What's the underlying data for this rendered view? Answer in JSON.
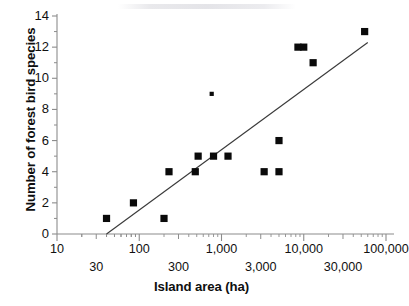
{
  "chart_data": {
    "type": "scatter",
    "title": "",
    "xlabel": "Island area (ha)",
    "ylabel": "Number of forest bird species",
    "xscale": "log",
    "xlim": [
      10,
      100000
    ],
    "ylim": [
      0,
      14
    ],
    "grid": false,
    "legend": "none",
    "y_ticks": [
      0,
      2,
      4,
      6,
      8,
      10,
      12,
      14
    ],
    "y_tick_labels": [
      "0",
      "2",
      "4",
      "6",
      "8",
      "10",
      "12",
      "14"
    ],
    "y_minor_ticks": [
      1,
      3,
      5,
      7,
      9,
      11,
      13
    ],
    "x_ticks_upper": [
      10,
      100,
      1000,
      10000,
      100000
    ],
    "x_tick_labels_upper": [
      "10",
      "100",
      "1,000",
      "10,000",
      "100,000"
    ],
    "x_ticks_lower": [
      30,
      300,
      3000,
      30000
    ],
    "x_tick_labels_lower": [
      "30",
      "300",
      "3,000",
      "30,000"
    ],
    "points": [
      {
        "x": 40,
        "y": 1,
        "size": "normal"
      },
      {
        "x": 85,
        "y": 2,
        "size": "normal"
      },
      {
        "x": 200,
        "y": 1,
        "size": "normal"
      },
      {
        "x": 230,
        "y": 4,
        "size": "normal"
      },
      {
        "x": 480,
        "y": 4,
        "size": "normal"
      },
      {
        "x": 520,
        "y": 5,
        "size": "normal"
      },
      {
        "x": 760,
        "y": 9,
        "size": "small"
      },
      {
        "x": 800,
        "y": 5,
        "size": "normal"
      },
      {
        "x": 1200,
        "y": 5,
        "size": "normal"
      },
      {
        "x": 3300,
        "y": 4,
        "size": "normal"
      },
      {
        "x": 5000,
        "y": 4,
        "size": "normal"
      },
      {
        "x": 5000,
        "y": 6,
        "size": "normal"
      },
      {
        "x": 8500,
        "y": 12,
        "size": "normal"
      },
      {
        "x": 10000,
        "y": 12,
        "size": "normal"
      },
      {
        "x": 13000,
        "y": 11,
        "size": "normal"
      },
      {
        "x": 55000,
        "y": 13,
        "size": "normal"
      }
    ],
    "trendline": {
      "x_start": 40,
      "y_start": 0,
      "x_end": 60000,
      "y_end": 12.3
    },
    "marker_color": "#0a0a0a",
    "line_color": "#3a3a3a",
    "axis_color": "#8c8c8c"
  }
}
